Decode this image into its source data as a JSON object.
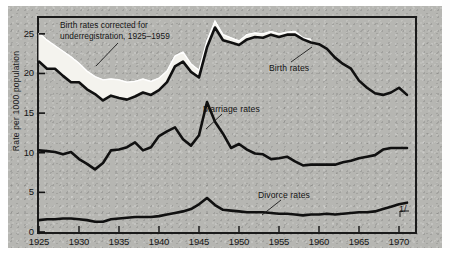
{
  "chart_data": {
    "type": "line",
    "title": "",
    "xlabel": "",
    "ylabel": "Rate per 1000 population",
    "xlim": [
      1925,
      1972
    ],
    "ylim": [
      0,
      27
    ],
    "grid": false,
    "legend_position": "inline-annotations",
    "xticks": [
      "1925",
      "1930",
      "1935",
      "1940",
      "1945",
      "1950",
      "1955",
      "1960",
      "1965",
      "1970"
    ],
    "xtick_values": [
      1925,
      1930,
      1935,
      1940,
      1945,
      1950,
      1955,
      1960,
      1965,
      1970
    ],
    "yticks": [
      "0",
      "5",
      "10",
      "15",
      "20",
      "25"
    ],
    "ytick_values": [
      0,
      5,
      10,
      15,
      20,
      25
    ],
    "annotations": [
      {
        "name": "birth-corrected-note",
        "text": "Birth rates corrected for\nunderregistration, 1925–1959"
      },
      {
        "name": "footnote-marker",
        "text": "1/"
      }
    ],
    "series": [
      {
        "name": "Birth rates corrected for underregistration",
        "label": "Birth rates corrected for underregistration, 1925–1959",
        "style": "band-upper-white-fill",
        "x": [
          1925,
          1926,
          1927,
          1928,
          1929,
          1930,
          1931,
          1932,
          1933,
          1934,
          1935,
          1936,
          1937,
          1938,
          1939,
          1940,
          1941,
          1942,
          1943,
          1944,
          1945,
          1946,
          1947,
          1948,
          1949,
          1950,
          1951,
          1952,
          1953,
          1954,
          1955,
          1956,
          1957,
          1958,
          1959
        ],
        "values": [
          25.1,
          24.2,
          23.5,
          22.8,
          22.1,
          21.3,
          20.3,
          19.6,
          19.2,
          19.3,
          19.2,
          18.9,
          19.0,
          19.3,
          19.0,
          19.4,
          20.3,
          22.2,
          22.7,
          21.2,
          20.4,
          24.1,
          26.6,
          24.9,
          24.5,
          24.1,
          24.9,
          25.1,
          25.0,
          25.3,
          25.0,
          25.2,
          25.3,
          24.5,
          24.3
        ]
      },
      {
        "name": "Birth rates",
        "label": "Birth rates",
        "style": "heavy-black-line",
        "x": [
          1925,
          1926,
          1927,
          1928,
          1929,
          1930,
          1931,
          1932,
          1933,
          1934,
          1935,
          1936,
          1937,
          1938,
          1939,
          1940,
          1941,
          1942,
          1943,
          1944,
          1945,
          1946,
          1947,
          1948,
          1949,
          1950,
          1951,
          1952,
          1953,
          1954,
          1955,
          1956,
          1957,
          1958,
          1959,
          1960,
          1961,
          1962,
          1963,
          1964,
          1965,
          1966,
          1967,
          1968,
          1969,
          1970,
          1971
        ],
        "values": [
          21.5,
          20.6,
          20.6,
          19.7,
          18.9,
          18.9,
          18.0,
          17.4,
          16.6,
          17.2,
          16.9,
          16.7,
          17.1,
          17.6,
          17.3,
          17.9,
          18.9,
          20.9,
          21.5,
          20.2,
          19.5,
          23.3,
          25.8,
          24.2,
          23.9,
          23.6,
          24.3,
          24.6,
          24.5,
          24.9,
          24.6,
          24.9,
          24.9,
          24.3,
          23.9,
          23.7,
          23.1,
          22.0,
          21.2,
          20.6,
          19.1,
          18.2,
          17.5,
          17.3,
          17.6,
          18.2,
          17.3
        ]
      },
      {
        "name": "Marriage rates",
        "label": "Marriage rates",
        "style": "heavy-black-line",
        "x": [
          1925,
          1926,
          1927,
          1928,
          1929,
          1930,
          1931,
          1932,
          1933,
          1934,
          1935,
          1936,
          1937,
          1938,
          1939,
          1940,
          1941,
          1942,
          1943,
          1944,
          1945,
          1946,
          1947,
          1948,
          1949,
          1950,
          1951,
          1952,
          1953,
          1954,
          1955,
          1956,
          1957,
          1958,
          1959,
          1960,
          1961,
          1962,
          1963,
          1964,
          1965,
          1966,
          1967,
          1968,
          1969,
          1970,
          1971
        ],
        "values": [
          10.3,
          10.2,
          10.1,
          9.8,
          10.1,
          9.2,
          8.6,
          7.9,
          8.7,
          10.3,
          10.4,
          10.7,
          11.3,
          10.3,
          10.7,
          12.1,
          12.7,
          13.2,
          11.7,
          10.9,
          12.2,
          16.4,
          13.9,
          12.4,
          10.6,
          11.1,
          10.4,
          9.9,
          9.8,
          9.2,
          9.3,
          9.5,
          8.9,
          8.4,
          8.5,
          8.5,
          8.5,
          8.5,
          8.8,
          9.0,
          9.3,
          9.5,
          9.7,
          10.4,
          10.6,
          10.6,
          10.6
        ]
      },
      {
        "name": "Divorce rates",
        "label": "Divorce rates",
        "style": "heavy-black-line",
        "x": [
          1925,
          1926,
          1927,
          1928,
          1929,
          1930,
          1931,
          1932,
          1933,
          1934,
          1935,
          1936,
          1937,
          1938,
          1939,
          1940,
          1941,
          1942,
          1943,
          1944,
          1945,
          1946,
          1947,
          1948,
          1949,
          1950,
          1951,
          1952,
          1953,
          1954,
          1955,
          1956,
          1957,
          1958,
          1959,
          1960,
          1961,
          1962,
          1963,
          1964,
          1965,
          1966,
          1967,
          1968,
          1969,
          1970,
          1971
        ],
        "values": [
          1.5,
          1.6,
          1.6,
          1.7,
          1.7,
          1.6,
          1.5,
          1.3,
          1.3,
          1.6,
          1.7,
          1.8,
          1.9,
          1.9,
          1.9,
          2.0,
          2.2,
          2.4,
          2.6,
          2.9,
          3.5,
          4.3,
          3.4,
          2.8,
          2.7,
          2.6,
          2.5,
          2.5,
          2.5,
          2.4,
          2.3,
          2.3,
          2.2,
          2.1,
          2.2,
          2.2,
          2.3,
          2.2,
          2.3,
          2.4,
          2.5,
          2.5,
          2.6,
          2.9,
          3.2,
          3.5,
          3.7
        ]
      }
    ]
  }
}
